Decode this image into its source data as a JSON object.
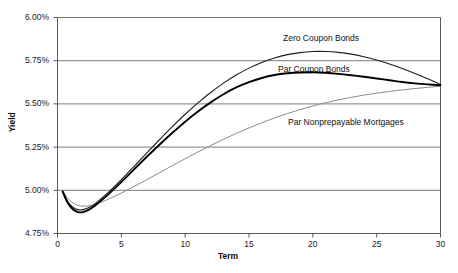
{
  "chart_data": {
    "type": "line",
    "title": "",
    "xlabel": "Term",
    "ylabel": "Yield",
    "xlim": [
      0,
      30
    ],
    "ylim": [
      4.75,
      6.0
    ],
    "grid": "horizontal",
    "legend_position": "inline-annotations",
    "xticks": [
      "0",
      "5",
      "10",
      "15",
      "20",
      "25",
      "30"
    ],
    "xtick_values": [
      0,
      5,
      10,
      15,
      20,
      25,
      30
    ],
    "yticks": [
      "4.75%",
      "5.00%",
      "5.25%",
      "5.50%",
      "5.75%",
      "6.00%"
    ],
    "ytick_values": [
      4.75,
      5.0,
      5.25,
      5.5,
      5.75,
      6.0
    ],
    "series": [
      {
        "name": "Zero Coupon Bonds",
        "color": "#1c1c1c",
        "width": 1.1,
        "label_x": 283,
        "label_y": 34,
        "x": [
          0.4,
          0.8,
          1.2,
          1.6,
          2.0,
          2.5,
          3.0,
          4.0,
          5.0,
          6.0,
          7.0,
          8.0,
          9.0,
          10.0,
          11.0,
          12.0,
          13.0,
          14.0,
          15.0,
          16.0,
          17.0,
          18.0,
          19.0,
          20.0,
          21.0,
          22.0,
          23.0,
          24.0,
          25.0,
          26.0,
          27.0,
          28.0,
          29.0,
          30.0
        ],
        "y": [
          4.995,
          4.935,
          4.902,
          4.888,
          4.888,
          4.902,
          4.926,
          4.989,
          5.062,
          5.139,
          5.217,
          5.294,
          5.369,
          5.44,
          5.506,
          5.566,
          5.62,
          5.667,
          5.707,
          5.74,
          5.766,
          5.785,
          5.797,
          5.803,
          5.803,
          5.798,
          5.788,
          5.773,
          5.754,
          5.731,
          5.705,
          5.676,
          5.645,
          5.612
        ]
      },
      {
        "name": "Par Coupon Bonds",
        "color": "#000000",
        "width": 1.9,
        "label_x": 278,
        "label_y": 65,
        "x": [
          0.4,
          0.8,
          1.2,
          1.6,
          2.0,
          2.5,
          3.0,
          4.0,
          5.0,
          6.0,
          7.0,
          8.0,
          9.0,
          10.0,
          11.0,
          12.0,
          13.0,
          14.0,
          15.0,
          16.0,
          17.0,
          18.0,
          19.0,
          20.0,
          21.0,
          22.0,
          23.0,
          24.0,
          25.0,
          26.0,
          27.0,
          28.0,
          29.0,
          30.0
        ],
        "y": [
          4.993,
          4.928,
          4.89,
          4.874,
          4.874,
          4.89,
          4.915,
          4.978,
          5.048,
          5.121,
          5.194,
          5.265,
          5.333,
          5.397,
          5.456,
          5.509,
          5.556,
          5.595,
          5.626,
          5.65,
          5.667,
          5.677,
          5.682,
          5.683,
          5.68,
          5.674,
          5.666,
          5.657,
          5.647,
          5.637,
          5.627,
          5.619,
          5.613,
          5.608
        ]
      },
      {
        "name": "Par Nonprepayable Mortgages",
        "color": "#8c8c8c",
        "width": 1.0,
        "label_x": 288,
        "label_y": 118,
        "x": [
          0.4,
          0.8,
          1.2,
          1.6,
          2.0,
          2.5,
          3.0,
          4.0,
          5.0,
          6.0,
          7.0,
          8.0,
          9.0,
          10.0,
          11.0,
          12.0,
          13.0,
          14.0,
          15.0,
          16.0,
          17.0,
          18.0,
          19.0,
          20.0,
          21.0,
          22.0,
          23.0,
          24.0,
          25.0,
          26.0,
          27.0,
          28.0,
          29.0,
          30.0
        ],
        "y": [
          4.999,
          4.955,
          4.928,
          4.913,
          4.908,
          4.911,
          4.92,
          4.949,
          4.984,
          5.022,
          5.062,
          5.102,
          5.143,
          5.183,
          5.222,
          5.259,
          5.295,
          5.329,
          5.361,
          5.391,
          5.419,
          5.444,
          5.467,
          5.488,
          5.507,
          5.523,
          5.538,
          5.551,
          5.562,
          5.572,
          5.581,
          5.589,
          5.596,
          5.602
        ]
      }
    ]
  },
  "colors": {
    "axis": "#595959",
    "grid": "#6e6e6e",
    "text": "#1a1a1a",
    "background": "#ffffff"
  }
}
